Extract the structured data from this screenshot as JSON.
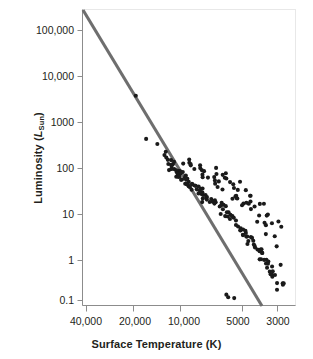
{
  "figure": {
    "background_color": "#ffffff",
    "frame_color": "#e6e6e6",
    "axis_color": "#808080",
    "point_color": "#1a1a1a",
    "line_color": "#6e6e6e"
  },
  "axes": {
    "x_title": "Surface Temperature (K)",
    "y_title_main": "Luminosity (",
    "y_title_symbol": "L",
    "y_title_sub": "Sun",
    "y_title_close": ")",
    "x_ticks": [
      "40,000",
      "20,000",
      "10,000",
      "5000",
      "3000"
    ],
    "y_ticks": [
      "100,000",
      "10,000",
      "1000",
      "100",
      "10",
      "1",
      "0.1"
    ]
  },
  "chart_data": {
    "type": "scatter",
    "title": "",
    "xlabel": "Surface Temperature (K)",
    "ylabel": "Luminosity (L_Sun)",
    "xscale": "log-reversed",
    "yscale": "log",
    "xlim": [
      45000,
      2600
    ],
    "ylim": [
      0.03,
      300000
    ],
    "grid": false,
    "legend": null,
    "x_tick_values": [
      40000,
      20000,
      10000,
      5000,
      3000
    ],
    "y_tick_values": [
      100000,
      10000,
      1000,
      100,
      10,
      1,
      0.1
    ],
    "series": [
      {
        "name": "Main sequence fit line",
        "type": "line",
        "color": "#6e6e6e",
        "points": [
          [
            45000,
            250000
          ],
          [
            4200,
            0.035
          ]
        ]
      },
      {
        "name": "Stars",
        "type": "scatter",
        "color": "#1a1a1a",
        "x": [
          21000,
          18600,
          14500,
          14000,
          13700,
          13400,
          13100,
          12900,
          12700,
          12600,
          12500,
          12400,
          12300,
          12200,
          12100,
          12000,
          11900,
          11800,
          11750,
          11700,
          11650,
          11600,
          11550,
          11500,
          11450,
          11400,
          11350,
          11300,
          11250,
          11200,
          11100,
          11000,
          10900,
          10800,
          10700,
          10600,
          10500,
          10400,
          10300,
          10200,
          10100,
          10000,
          9900,
          9800,
          9700,
          9600,
          9500,
          9400,
          9300,
          9200,
          9100,
          9000,
          8900,
          8800,
          8700,
          8600,
          8500,
          8400,
          8300,
          8200,
          8100,
          8000,
          7900,
          7800,
          7700,
          7600,
          7500,
          7400,
          7300,
          7200,
          7100,
          7000,
          6900,
          6800,
          6700,
          6600,
          6500,
          6400,
          6300,
          6200,
          6100,
          6000,
          5900,
          5800,
          5700,
          5600,
          5500,
          5400,
          5300,
          5200,
          5100,
          5000,
          4950,
          4900,
          4850,
          4800,
          4750,
          4700,
          4650,
          4600,
          4550,
          4500,
          4450,
          4400,
          4350,
          4300,
          4250,
          4200,
          4150,
          4100,
          4050,
          4000,
          3950,
          3900,
          3850,
          3800,
          3750,
          3700,
          3650,
          3600,
          3550,
          3500,
          3450,
          3400,
          3350,
          3300,
          3250,
          3200,
          3150,
          3100,
          3050,
          3000,
          2950,
          2900,
          2880,
          2860,
          5800,
          5600,
          5400,
          5200,
          7200,
          6900,
          6600,
          6300,
          6000,
          5700,
          5400,
          5100,
          4800,
          4500,
          4200,
          3900,
          3600,
          3300,
          3000,
          9500,
          9000,
          8500,
          8000,
          7500,
          7000,
          6500,
          6000,
          5500,
          5000,
          4500,
          4000,
          3500,
          3200,
          2950,
          10500,
          10200,
          9800,
          9400,
          9000,
          8600,
          8200,
          7800,
          7400,
          7000,
          6600,
          6200,
          5800,
          5400,
          5000,
          4600,
          4200,
          3800,
          3400,
          3050,
          4800,
          4400,
          4000,
          3700,
          3400,
          3150,
          2980,
          5200,
          4900,
          4600
        ],
        "y": [
          4100,
          470,
          260,
          200,
          175,
          150,
          130,
          120,
          110,
          105,
          100,
          97,
          95,
          92,
          90,
          88,
          86,
          84,
          82,
          80,
          78,
          76,
          74,
          72,
          70,
          68,
          66,
          64,
          62,
          60,
          58,
          56,
          54,
          52,
          50,
          48,
          46,
          44,
          43,
          42,
          41,
          40,
          38,
          37,
          36,
          35,
          34,
          33,
          32,
          31,
          30,
          29,
          28,
          27,
          26,
          25,
          24,
          23,
          22,
          21,
          20,
          19,
          18.5,
          18,
          17.5,
          17,
          16.5,
          16,
          15.5,
          15,
          14.5,
          14,
          13.5,
          13,
          12.5,
          12,
          11.5,
          11,
          10.5,
          10,
          9.5,
          9,
          8.5,
          8,
          7.5,
          7,
          6.5,
          6,
          5.5,
          5,
          4.8,
          4.5,
          4.2,
          4,
          3.8,
          3.6,
          3.4,
          3.2,
          3,
          2.8,
          2.6,
          2.4,
          2.2,
          2.1,
          2,
          1.9,
          1.8,
          1.7,
          1.6,
          1.5,
          1.4,
          1.3,
          1.2,
          1.1,
          1.0,
          0.95,
          0.9,
          0.85,
          0.8,
          0.75,
          0.7,
          0.65,
          0.6,
          0.55,
          0.5,
          0.45,
          0.42,
          0.4,
          0.37,
          0.34,
          0.3,
          0.28,
          0.25,
          0.22,
          0.2,
          0.18,
          0.16,
          0.14,
          0.1,
          0.085,
          95,
          80,
          70,
          60,
          55,
          48,
          42,
          36,
          30,
          25,
          20,
          16,
          12,
          9,
          6.5,
          120,
          105,
          88,
          72,
          60,
          50,
          42,
          35,
          28,
          22,
          17,
          13,
          9,
          6,
          3.5,
          140,
          125,
          110,
          98,
          85,
          74,
          64,
          55,
          47,
          40,
          34,
          28,
          23,
          19,
          15,
          12,
          9.5,
          7,
          4.5,
          2.5,
          18,
          13,
          9,
          6,
          3.2,
          1.4,
          0.6,
          26,
          21,
          16
        ]
      }
    ]
  }
}
